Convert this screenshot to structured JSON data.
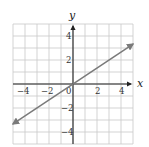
{
  "chart_data": {
    "type": "line",
    "title": "",
    "xlabel": "x",
    "ylabel": "y",
    "xlim": [
      -5,
      5
    ],
    "ylim": [
      -5,
      5
    ],
    "grid": true,
    "x_ticks": [
      -4,
      -2,
      0,
      2,
      4
    ],
    "y_ticks": [
      -4,
      -2,
      2,
      4
    ],
    "x_tick_labels": [
      "−4",
      "−2",
      "0",
      "2",
      "4"
    ],
    "y_tick_labels": [
      "−4",
      "−2",
      "2",
      "4"
    ],
    "series": [
      {
        "name": "y = (2/3)x",
        "equation": "y = 2x/3",
        "x": [
          -5,
          5
        ],
        "y": [
          -3.33,
          3.33
        ],
        "arrows": "both"
      }
    ],
    "colors": {
      "line": "#7a7a7a",
      "axis": "#222222",
      "grid": "#c8c8c8"
    }
  },
  "labels": {
    "x_axis": "x",
    "y_axis": "y",
    "tick_neg4": "−4",
    "tick_neg2": "−2",
    "tick_0": "0",
    "tick_2": "2",
    "tick_4": "4",
    "ytick_4": "4",
    "ytick_2": "2",
    "ytick_neg2": "−2",
    "ytick_neg4": "−4"
  }
}
